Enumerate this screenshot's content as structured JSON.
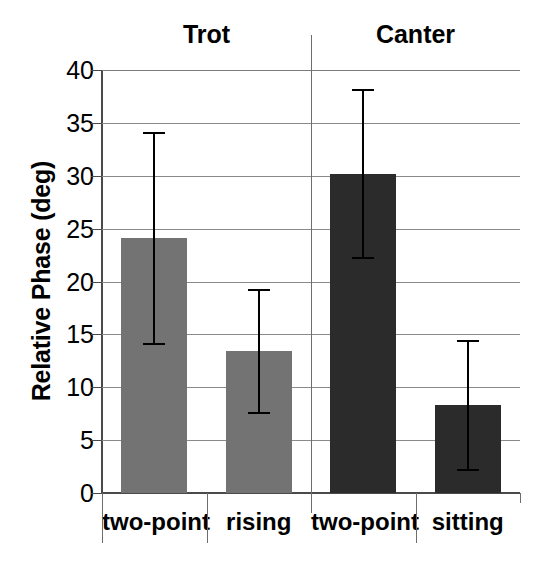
{
  "chart_data": {
    "type": "bar",
    "title": "",
    "xlabel": "",
    "ylabel": "Relative Phase (deg)",
    "ylim": [
      0,
      40
    ],
    "ytick_step": 5,
    "yticks": [
      "0",
      "5",
      "10",
      "15",
      "20",
      "25",
      "30",
      "35",
      "40"
    ],
    "grid": true,
    "legend": "none",
    "categories": [
      "two-point",
      "rising",
      "two-point",
      "sitting"
    ],
    "groups": [
      {
        "label": "Trot",
        "categories": [
          "two-point",
          "rising"
        ]
      },
      {
        "label": "Canter",
        "categories": [
          "two-point",
          "sitting"
        ]
      }
    ],
    "values": [
      24.1,
      13.4,
      30.2,
      8.3
    ],
    "errors_low": [
      14.0,
      7.5,
      22.1,
      2.1
    ],
    "errors_high": [
      34.1,
      19.3,
      38.2,
      14.5
    ],
    "bars": [
      {
        "category": "two-point",
        "group": "Trot",
        "value": 24.1,
        "error_low": 14.0,
        "error_high": 34.1,
        "color": "#737373"
      },
      {
        "category": "rising",
        "group": "Trot",
        "value": 13.4,
        "error_low": 7.5,
        "error_high": 19.3,
        "color": "#737373"
      },
      {
        "category": "two-point",
        "group": "Canter",
        "value": 30.2,
        "error_low": 22.1,
        "error_high": 38.2,
        "color": "#2b2b2b"
      },
      {
        "category": "sitting",
        "group": "Canter",
        "value": 8.3,
        "error_low": 2.1,
        "error_high": 14.5,
        "color": "#2b2b2b"
      }
    ],
    "colors": {
      "trot_bar": "#737373",
      "canter_bar": "#2b2b2b",
      "gridline": "#8a8a8a",
      "axis": "#4a4a4a",
      "errorbar": "#000000",
      "background": "#ffffff",
      "text": "#000000"
    }
  },
  "axis": {
    "y_title": "Relative Phase (deg)",
    "y_ticks": [
      "40",
      "35",
      "30",
      "25",
      "20",
      "15",
      "10",
      "5",
      "0"
    ]
  },
  "groups": {
    "left_label": "Trot",
    "right_label": "Canter"
  },
  "categories": {
    "c0": "two-point",
    "c1": "rising",
    "c2": "two-point",
    "c3": "sitting"
  }
}
